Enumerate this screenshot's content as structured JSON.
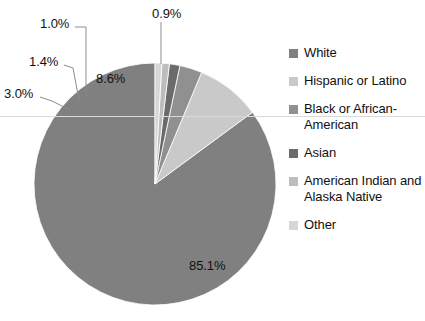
{
  "chart_data": {
    "type": "pie",
    "title": "",
    "categories": [
      "White",
      "Hispanic or Latino",
      "Black or African-American",
      "Asian",
      "American Indian and Alaska Native",
      "Other"
    ],
    "values": [
      85.1,
      8.6,
      3.0,
      1.4,
      1.0,
      0.9
    ],
    "value_labels": [
      "85.1%",
      "8.6%",
      "3.0%",
      "1.4%",
      "1.0%",
      "0.9%"
    ],
    "unit": "percent",
    "colors": [
      "#808080",
      "#c9c9c9",
      "#909090",
      "#6b6b6b",
      "#bdbdbd",
      "#d6d6d6"
    ],
    "legend_position": "right",
    "grid": false,
    "start_angle_deg": 0,
    "direction": "counterclockwise"
  },
  "labels": {
    "white": "85.1%",
    "hispanic": "8.6%",
    "black": "3.0%",
    "asian": "1.4%",
    "american_indian": "1.0%",
    "other": "0.9%"
  },
  "legend": {
    "items": [
      {
        "label": "White",
        "color": "#808080"
      },
      {
        "label": "Hispanic or Latino",
        "color": "#c9c9c9"
      },
      {
        "label": "Black or African-American",
        "color": "#909090"
      },
      {
        "label": "Asian",
        "color": "#6b6b6b"
      },
      {
        "label": "American Indian and Alaska Native",
        "color": "#bdbdbd"
      },
      {
        "label": "Other",
        "color": "#d6d6d6"
      }
    ]
  }
}
